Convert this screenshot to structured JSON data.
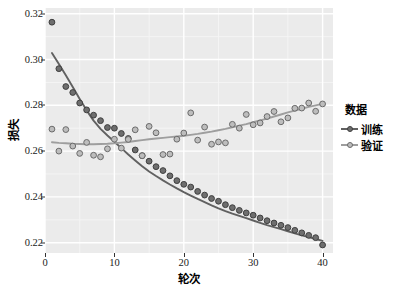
{
  "chart_data": {
    "type": "scatter",
    "title": "",
    "xlabel": "轮次",
    "ylabel": "损失",
    "xlim": [
      0,
      41.5
    ],
    "ylim": [
      0.2155,
      0.3225
    ],
    "xticks": [
      0,
      10,
      20,
      30,
      40
    ],
    "yticks": [
      0.22,
      0.24,
      0.26,
      0.28,
      0.3,
      0.32
    ],
    "ytick_labels": [
      "0.22",
      "0.24",
      "0.26",
      "0.28",
      "0.30",
      "0.32"
    ],
    "xtick_labels": [
      "0",
      "10",
      "20",
      "30",
      "40"
    ],
    "grid": true,
    "grid_color": "#ffffff",
    "panel_background": "#ebebeb",
    "legend_position": "right",
    "legend_title": "数据",
    "x": [
      1,
      2,
      3,
      4,
      5,
      6,
      7,
      8,
      9,
      10,
      11,
      12,
      13,
      14,
      15,
      16,
      17,
      18,
      19,
      20,
      21,
      22,
      23,
      24,
      25,
      26,
      27,
      28,
      29,
      30,
      31,
      32,
      33,
      34,
      35,
      36,
      37,
      38,
      39,
      40
    ],
    "series": [
      {
        "name": "训练",
        "label": "训练",
        "color": "#5c5c5c",
        "marker": "circle",
        "has_smooth_line": true,
        "values": [
          0.3163,
          0.296,
          0.2882,
          0.2856,
          0.281,
          0.278,
          0.2757,
          0.2733,
          0.2703,
          0.27,
          0.2677,
          0.2655,
          0.2605,
          0.258,
          0.2556,
          0.2532,
          0.2515,
          0.2492,
          0.2471,
          0.2455,
          0.2443,
          0.2424,
          0.2408,
          0.2393,
          0.2381,
          0.2366,
          0.2353,
          0.2341,
          0.233,
          0.232,
          0.2308,
          0.2296,
          0.2286,
          0.2276,
          0.2266,
          0.2254,
          0.2243,
          0.2232,
          0.2222,
          0.219
        ]
      },
      {
        "name": "验证",
        "label": "验证",
        "color": "#8c8c8c",
        "marker": "circle",
        "has_smooth_line": true,
        "values": [
          0.2696,
          0.26,
          0.2694,
          0.2622,
          0.259,
          0.2638,
          0.2582,
          0.2575,
          0.261,
          0.2652,
          0.2613,
          0.2651,
          0.2693,
          0.258,
          0.2708,
          0.268,
          0.2585,
          0.2587,
          0.2652,
          0.2679,
          0.2767,
          0.2648,
          0.2705,
          0.263,
          0.264,
          0.2636,
          0.2717,
          0.27,
          0.276,
          0.2715,
          0.2723,
          0.2751,
          0.2773,
          0.2728,
          0.2745,
          0.2787,
          0.2788,
          0.281,
          0.2774,
          0.2806
        ]
      }
    ],
    "smooth_lines": [
      {
        "name": "训练",
        "color": "#616161",
        "points": [
          [
            1,
            0.3028
          ],
          [
            2,
            0.298
          ],
          [
            3,
            0.2931
          ],
          [
            4,
            0.288
          ],
          [
            5,
            0.2828
          ],
          [
            6,
            0.2778
          ],
          [
            7,
            0.2733
          ],
          [
            8,
            0.2697
          ],
          [
            9,
            0.2668
          ],
          [
            10,
            0.2641
          ],
          [
            11,
            0.2613
          ],
          [
            12,
            0.2585
          ],
          [
            13,
            0.2559
          ],
          [
            14,
            0.2534
          ],
          [
            15,
            0.2511
          ],
          [
            16,
            0.2491
          ],
          [
            17,
            0.2472
          ],
          [
            18,
            0.2454
          ],
          [
            19,
            0.2437
          ],
          [
            20,
            0.2421
          ],
          [
            21,
            0.2406
          ],
          [
            22,
            0.2391
          ],
          [
            23,
            0.2377
          ],
          [
            24,
            0.2363
          ],
          [
            25,
            0.235
          ],
          [
            26,
            0.2338
          ],
          [
            27,
            0.2327
          ],
          [
            28,
            0.2317
          ],
          [
            29,
            0.2307
          ],
          [
            30,
            0.2297
          ],
          [
            31,
            0.2287
          ],
          [
            32,
            0.2277
          ],
          [
            33,
            0.2268
          ],
          [
            34,
            0.2259
          ],
          [
            35,
            0.225
          ],
          [
            36,
            0.2241
          ],
          [
            37,
            0.2232
          ],
          [
            38,
            0.2224
          ],
          [
            39,
            0.2216
          ],
          [
            40,
            0.2208
          ]
        ]
      },
      {
        "name": "验证",
        "color": "#9e9e9e",
        "points": [
          [
            1,
            0.2639
          ],
          [
            2,
            0.2636
          ],
          [
            3,
            0.2634
          ],
          [
            4,
            0.2632
          ],
          [
            5,
            0.2631
          ],
          [
            6,
            0.263
          ],
          [
            7,
            0.263
          ],
          [
            8,
            0.2631
          ],
          [
            9,
            0.2632
          ],
          [
            10,
            0.2634
          ],
          [
            11,
            0.2637
          ],
          [
            12,
            0.264
          ],
          [
            13,
            0.2644
          ],
          [
            14,
            0.2648
          ],
          [
            15,
            0.2652
          ],
          [
            16,
            0.2655
          ],
          [
            17,
            0.2658
          ],
          [
            18,
            0.2661
          ],
          [
            19,
            0.2664
          ],
          [
            20,
            0.2667
          ],
          [
            21,
            0.2671
          ],
          [
            22,
            0.2675
          ],
          [
            23,
            0.268
          ],
          [
            24,
            0.2685
          ],
          [
            25,
            0.2691
          ],
          [
            26,
            0.2697
          ],
          [
            27,
            0.2704
          ],
          [
            28,
            0.2711
          ],
          [
            29,
            0.2718
          ],
          [
            30,
            0.2726
          ],
          [
            31,
            0.2734
          ],
          [
            32,
            0.2742
          ],
          [
            33,
            0.2751
          ],
          [
            34,
            0.276
          ],
          [
            35,
            0.2769
          ],
          [
            36,
            0.2777
          ],
          [
            37,
            0.2785
          ],
          [
            38,
            0.2793
          ],
          [
            39,
            0.28
          ],
          [
            40,
            0.2806
          ]
        ]
      }
    ]
  },
  "legend": {
    "title": "数据",
    "items": [
      {
        "label": "训练",
        "color": "#5c5c5c"
      },
      {
        "label": "验证",
        "color": "#8c8c8c"
      }
    ]
  },
  "axes": {
    "x_title": "轮次",
    "y_title": "损失"
  }
}
